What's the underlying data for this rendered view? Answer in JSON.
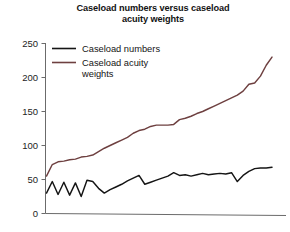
{
  "chart_data": {
    "type": "line",
    "title": "Caseload numbers versus caseload\nacuity weights",
    "title_line1": "Caseload numbers versus caseload",
    "title_line2": "acuity weights",
    "xlabel": "",
    "ylabel": "",
    "ylim": [
      0,
      250
    ],
    "yticks": [
      0,
      50,
      100,
      150,
      200,
      250
    ],
    "ytick_labels": [
      "0",
      "50",
      "100",
      "150",
      "200",
      "250"
    ],
    "xticks": [],
    "xtick_labels": [],
    "grid": false,
    "legend_position": "upper-left-inside",
    "x": [
      1,
      2,
      3,
      4,
      5,
      6,
      7,
      8,
      9,
      10,
      11,
      12,
      13,
      14,
      15,
      16,
      17,
      18,
      19,
      20,
      21,
      22,
      23,
      24,
      25,
      26,
      27,
      28,
      29,
      30,
      31,
      32,
      33,
      34,
      35,
      36,
      37,
      38,
      39,
      40
    ],
    "series": [
      {
        "name": "Caseload numbers",
        "color": "#151515",
        "values": [
          30,
          47,
          28,
          46,
          27,
          45,
          25,
          49,
          47,
          37,
          30,
          35,
          39,
          43,
          48,
          52,
          56,
          43,
          46,
          49,
          52,
          55,
          60,
          56,
          57,
          55,
          57,
          59,
          57,
          58,
          59,
          58,
          60,
          47,
          56,
          62,
          66,
          67,
          67,
          68
        ]
      },
      {
        "name": "Caseload acuity weights",
        "color": "#6e4040",
        "values": [
          55,
          72,
          76,
          77,
          79,
          80,
          83,
          84,
          86,
          91,
          96,
          100,
          104,
          108,
          112,
          118,
          122,
          124,
          128,
          130,
          130,
          130,
          131,
          138,
          140,
          143,
          147,
          150,
          154,
          158,
          162,
          166,
          170,
          174,
          180,
          190,
          192,
          202,
          218,
          230
        ]
      }
    ]
  },
  "legend": {
    "entries": [
      {
        "label": "Caseload numbers",
        "color": "#151515"
      },
      {
        "label": "Caseload acuity",
        "label2": "weights",
        "color": "#6e4040"
      }
    ]
  },
  "axes": {
    "y_axis_name": "y-axis",
    "x_axis_name": "x-axis"
  }
}
